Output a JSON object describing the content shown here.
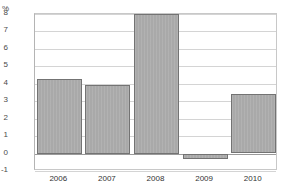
{
  "chart_data": {
    "type": "bar",
    "title": "",
    "xlabel": "",
    "ylabel": "%",
    "unit_label": "%",
    "categories": [
      "2006",
      "2007",
      "2008",
      "2009",
      "2010"
    ],
    "values": [
      4.3,
      3.95,
      8.0,
      -0.3,
      3.4
    ],
    "series": [
      {
        "name": "",
        "values": [
          4.3,
          3.95,
          8.0,
          -0.3,
          3.4
        ]
      }
    ],
    "ylim": [
      -1,
      8
    ],
    "ytick_labels": [
      "8",
      "7",
      "6",
      "5",
      "4",
      "3",
      "2",
      "1",
      "0",
      "-1"
    ],
    "ytick_values": [
      8,
      7,
      6,
      5,
      4,
      3,
      2,
      1,
      0,
      -1
    ],
    "grid": true,
    "legend": "none",
    "bar_color": "#a9a9a9",
    "bar_border_color": "#737373",
    "gridline_color": "#d4d4d4",
    "zero_line_color": "#9a9a9a",
    "axis_color": "#b4b4b4",
    "background": "#ffffff"
  }
}
